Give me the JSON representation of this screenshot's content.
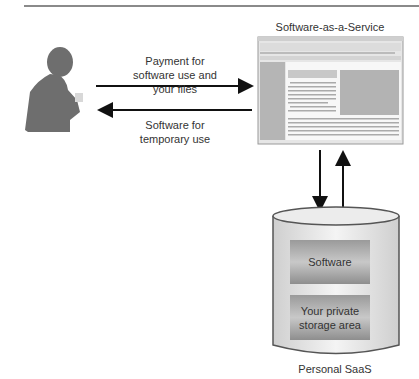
{
  "diagram": {
    "user_label": "",
    "arrow_top": {
      "label_line1": "Payment for",
      "label_line2": "software use and",
      "label_line3": "your files"
    },
    "arrow_bottom": {
      "label_line1": "Software for",
      "label_line2": "temporary use"
    },
    "window": {
      "title": "Software-as-a-Service"
    },
    "cylinder": {
      "label": "Personal SaaS",
      "box_top": "Software",
      "box_bottom_line1": "Your private",
      "box_bottom_line2": "storage area"
    }
  }
}
